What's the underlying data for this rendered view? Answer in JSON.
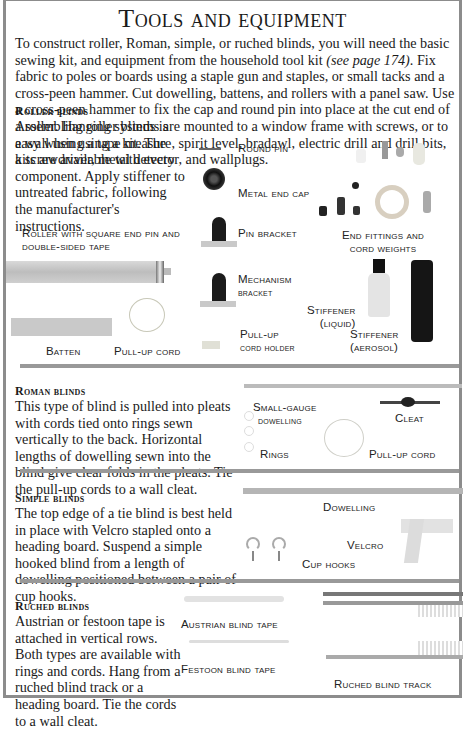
{
  "title": "Tools and equipment",
  "intro": {
    "text_before": "To construct roller, Roman, simple, or ruched blinds, you will need the basic sewing kit, and equipment from the household tool kit ",
    "reference": "(see page 174)",
    "text_after": ". Fix fabric to poles or boards using a staple gun and staples, or small tacks and a cross-peen hammer. Cut dowelling, battens, and rollers with a panel saw. Use a cross-peen hammer to fix the cap and round pin into place at the cut end of a roller. Hanging systems are mounted to a window frame with screws, or to a wall using a tape measure, spirit level, bradawl, electric drill and drill bits, a screwdriver, metal detector, and wallplugs."
  },
  "sections": {
    "roller": {
      "heading": "Roller blinds",
      "text": "Assembling roller blinds is easy when using a kit. The kits are available with every component. Apply stiffener to untreated fabric, following the manufacturer's instructions.",
      "labels": {
        "roller": "Roller with square end pin and double-sided tape",
        "round_pin": "Round pin",
        "metal_end_cap": "Metal end cap",
        "pin_bracket": "Pin bracket",
        "end_fittings": "End fittings and cord weights",
        "mechanism_bracket_1": "Mechanism",
        "mechanism_bracket_2": "bracket",
        "stiffener_liquid_1": "Stiffener",
        "stiffener_liquid_2": "(liquid)",
        "stiffener_aerosol_1": "Stiffener",
        "stiffener_aerosol_2": "(aerosol)",
        "batten": "Batten",
        "pull_up_cord": "Pull-up cord",
        "cord_holder_1": "Pull-up",
        "cord_holder_2": "cord holder"
      }
    },
    "roman": {
      "heading": "Roman blinds",
      "text": "This type of blind is pulled into pleats with cords tied onto rings sewn vertically to the back. Horizontal lengths of dowelling sewn into the blind give clear folds in the pleats. Tie the pull-up cords to a wall cleat.",
      "labels": {
        "dowelling_1": "Small-gauge",
        "dowelling_2": "dowelling",
        "cleat": "Cleat",
        "rings": "Rings",
        "pull_up_cord": "Pull-up cord"
      }
    },
    "simple": {
      "heading": "Simple blinds",
      "text": "The top edge of a tie blind is best held in place with Velcro stapled onto a heading board. Suspend a simple hooked blind from a length of dowelling positioned between a pair of cup hooks.",
      "labels": {
        "dowelling": "Dowelling",
        "velcro": "Velcro",
        "cup_hooks": "Cup hooks"
      }
    },
    "ruched": {
      "heading": "Ruched blinds",
      "text": "Austrian or festoon tape is attached in vertical rows. Both types are available with rings and cords. Hang from a ruched blind track or a heading board. Tie the cords to a wall cleat.",
      "labels": {
        "austrian_tape": "Austrian blind tape",
        "festoon_tape": "Festoon blind tape",
        "track": "Ruched blind track"
      }
    }
  }
}
